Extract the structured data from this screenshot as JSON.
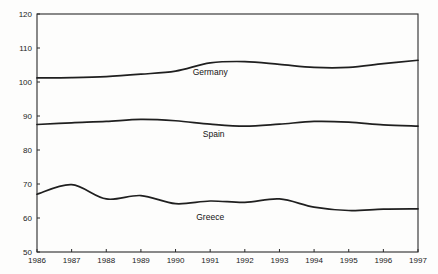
{
  "chart_data": {
    "type": "line",
    "title": "",
    "subtitle": "",
    "xlabel": "",
    "ylabel": "",
    "xlim": [
      1986,
      1997
    ],
    "ylim": [
      50,
      120
    ],
    "grid": false,
    "legend_position": "inline-labels",
    "x": [
      1986,
      1987,
      1988,
      1989,
      1990,
      1991,
      1992,
      1993,
      1994,
      1995,
      1996,
      1997
    ],
    "categories": [
      "1986",
      "1987",
      "1988",
      "1989",
      "1990",
      "1991",
      "1992",
      "1993",
      "1994",
      "1995",
      "1996",
      "1997"
    ],
    "y_ticks": [
      50,
      60,
      70,
      80,
      90,
      100,
      110,
      120
    ],
    "y_tick_labels": [
      "50",
      "60",
      "70",
      "80",
      "90",
      "100",
      "110",
      "120"
    ],
    "series": [
      {
        "name": "Germany",
        "color": "#1f1f1f",
        "values": [
          101.2,
          101.3,
          101.6,
          102.3,
          103.2,
          105.6,
          106.0,
          105.2,
          104.3,
          104.3,
          105.4,
          106.4
        ],
        "label_x": 1991.0,
        "label_y": 102.0
      },
      {
        "name": "Spain",
        "color": "#1f1f1f",
        "values": [
          87.5,
          88.0,
          88.4,
          89.0,
          88.6,
          87.6,
          87.0,
          87.6,
          88.4,
          88.2,
          87.4,
          87.0
        ],
        "label_x": 1991.1,
        "label_y": 83.8
      },
      {
        "name": "Greece",
        "color": "#1f1f1f",
        "values": [
          67.0,
          69.8,
          65.6,
          66.6,
          64.2,
          65.0,
          64.6,
          65.6,
          63.2,
          62.2,
          62.6,
          62.7
        ],
        "label_x": 1991.0,
        "label_y": 59.4
      }
    ]
  },
  "axes": {
    "y_axis_name": "value-axis",
    "x_axis_name": "year-axis"
  }
}
